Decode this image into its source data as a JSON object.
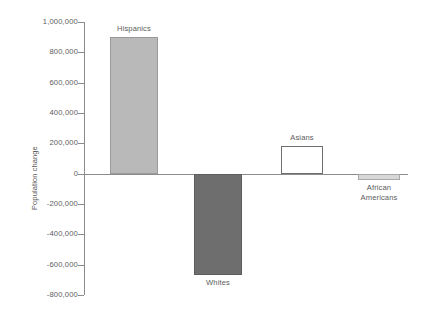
{
  "chart_data": {
    "type": "bar",
    "title": "",
    "xlabel": "",
    "ylabel": "Population change",
    "categories": [
      "Hispanics",
      "Whites",
      "Asians",
      "African Americans"
    ],
    "values": [
      900000,
      -670000,
      180000,
      -45000
    ],
    "ylim": [
      -800000,
      1000000
    ],
    "yticks": [
      1000000,
      800000,
      600000,
      400000,
      200000,
      0,
      -200000,
      -400000,
      -600000,
      -800000
    ],
    "ytick_labels": [
      "1,000,000",
      "800,000",
      "600,000",
      "400,000",
      "200,000",
      "0",
      "-200,000",
      "-400,000",
      "-600,000",
      "-800,000"
    ],
    "grid": false,
    "legend": "none",
    "bar_colors": [
      "#b9b9b9",
      "#6e6e6e",
      "#ffffff",
      "#d8d8d8"
    ],
    "bar_border_colors": [
      "#9a9a9a",
      "#5d5d5d",
      "#6f6f6f",
      "#a8a8a8"
    ],
    "axis_color": "#8c8c8c",
    "text_color": "#5c5c5c"
  },
  "bars": [
    {
      "label": "Hispanics",
      "value": 900000,
      "label_lines": [
        "Hispanics"
      ],
      "label_position": "above"
    },
    {
      "label": "Whites",
      "value": -670000,
      "label_lines": [
        "Whites"
      ],
      "label_position": "below"
    },
    {
      "label": "Asians",
      "value": 180000,
      "label_lines": [
        "Asians"
      ],
      "label_position": "above"
    },
    {
      "label": "African Americans",
      "value": -45000,
      "label_lines": [
        "African",
        "Americans"
      ],
      "label_position": "below"
    }
  ],
  "axis": {
    "y_title": "Population change",
    "ticks": [
      {
        "label": "1,000,000",
        "value": 1000000
      },
      {
        "label": "800,000",
        "value": 800000
      },
      {
        "label": "600,000",
        "value": 600000
      },
      {
        "label": "400,000",
        "value": 400000
      },
      {
        "label": "200,000",
        "value": 200000
      },
      {
        "label": "0",
        "value": 0
      },
      {
        "label": "-200,000",
        "value": -200000
      },
      {
        "label": "-400,000",
        "value": -400000
      },
      {
        "label": "-600,000",
        "value": -600000
      },
      {
        "label": "-800,000",
        "value": -800000
      }
    ]
  }
}
